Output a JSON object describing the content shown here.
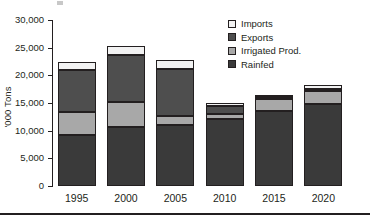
{
  "chart_data": {
    "type": "bar",
    "subtype": "stacked-bar",
    "title": "",
    "xlabel": "",
    "ylabel": "'000 Tons",
    "categories": [
      "1995",
      "2000",
      "2005",
      "2010",
      "2015",
      "2020"
    ],
    "ylim": [
      0,
      30000
    ],
    "yticks": [
      0,
      5000,
      10000,
      15000,
      20000,
      25000,
      30000
    ],
    "ytick_labels": [
      "0",
      "5,000",
      "10,000",
      "15,000",
      "20,000",
      "25,000",
      "30,000"
    ],
    "grid": false,
    "legend_position": "top-right",
    "series": [
      {
        "name": "Rainfed",
        "color": "#3a3a3a",
        "values": [
          9300,
          10600,
          11100,
          12100,
          13500,
          14900
        ]
      },
      {
        "name": "Irrigated Prod.",
        "color": "#a8a8a8",
        "values": [
          4000,
          4600,
          1600,
          900,
          2300,
          2300
        ]
      },
      {
        "name": "Exports",
        "color": "#4e4e4e",
        "values": [
          7700,
          8400,
          8500,
          1400,
          200,
          300
        ]
      },
      {
        "name": "Imports",
        "color": "#f2f2f2",
        "values": [
          1400,
          1700,
          1600,
          600,
          500,
          700
        ]
      }
    ],
    "totals": [
      22400,
      25300,
      22800,
      15000,
      16500,
      18200
    ]
  },
  "legend": {
    "items": [
      {
        "label": "Imports",
        "color": "#f2f2f2"
      },
      {
        "label": "Exports",
        "color": "#4e4e4e"
      },
      {
        "label": "Irrigated Prod.",
        "color": "#a8a8a8"
      },
      {
        "label": "Rainfed",
        "color": "#3a3a3a"
      }
    ]
  }
}
